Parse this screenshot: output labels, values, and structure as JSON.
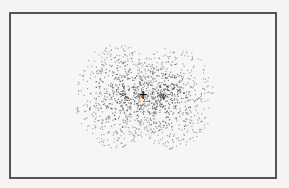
{
  "diagram": {
    "type": "p-orbital electron density dot diagram",
    "frame": {
      "border_color": "#555555",
      "background": "#f6f6f6"
    },
    "nucleus": {
      "symbol": "+",
      "x": 143,
      "y": 95
    },
    "lobes": [
      {
        "name": "left-lobe",
        "cx": 116,
        "cy": 96,
        "rx": 42,
        "ry": 52,
        "dots": 700
      },
      {
        "name": "right-lobe",
        "cx": 172,
        "cy": 97,
        "rx": 41,
        "ry": 52,
        "dots": 700
      }
    ],
    "dot_color": "#444444"
  }
}
